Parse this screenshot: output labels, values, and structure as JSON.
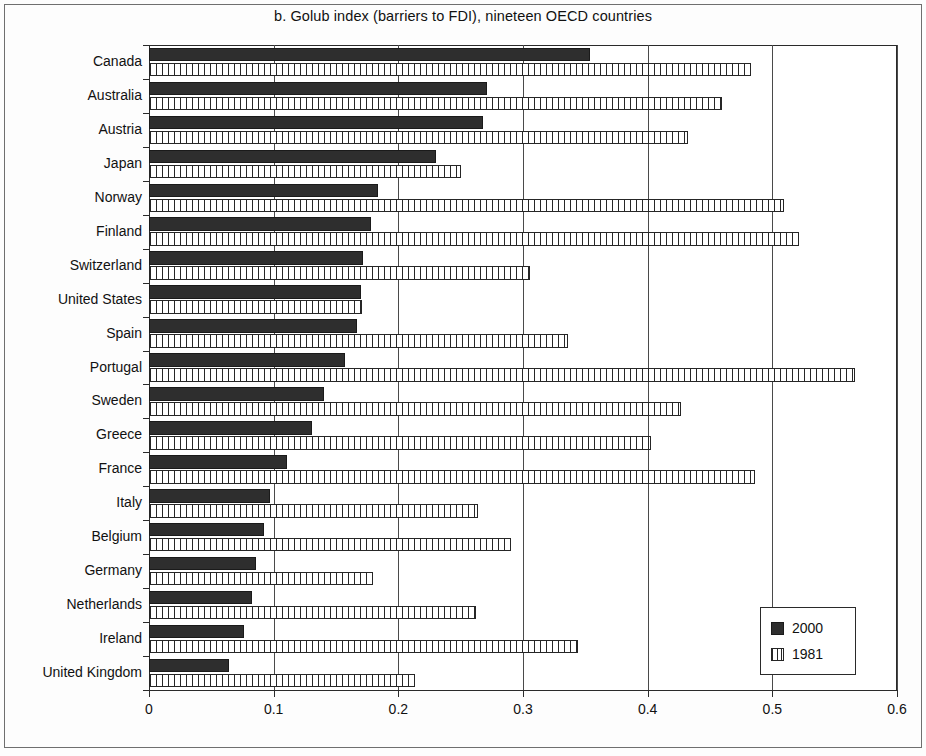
{
  "chart_data": {
    "type": "bar",
    "orientation": "horizontal",
    "title": "b. Golub index (barriers to FDI), nineteen OECD countries",
    "xlabel": "",
    "ylabel": "",
    "xlim": [
      0,
      0.6
    ],
    "xticks": [
      "0",
      "0.1",
      "0.2",
      "0.3",
      "0.4",
      "0.5",
      "0.6"
    ],
    "xtick_values": [
      0,
      0.1,
      0.2,
      0.3,
      0.4,
      0.5,
      0.6
    ],
    "grid": "vertical",
    "legend_position": "bottom-right",
    "categories": [
      "Canada",
      "Australia",
      "Austria",
      "Japan",
      "Norway",
      "Finland",
      "Switzerland",
      "United States",
      "Spain",
      "Portugal",
      "Sweden",
      "Greece",
      "France",
      "Italy",
      "Belgium",
      "Germany",
      "Netherlands",
      "Ireland",
      "United Kingdom"
    ],
    "series": [
      {
        "name": "2000",
        "color": "#2e2e2e",
        "fill": "solid",
        "values": [
          0.354,
          0.271,
          0.268,
          0.23,
          0.184,
          0.178,
          0.172,
          0.17,
          0.167,
          0.157,
          0.14,
          0.131,
          0.111,
          0.097,
          0.092,
          0.086,
          0.083,
          0.076,
          0.064
        ]
      },
      {
        "name": "1981",
        "color": "#ffffff",
        "fill": "hatched",
        "values": [
          0.483,
          0.46,
          0.432,
          0.25,
          0.509,
          0.521,
          0.306,
          0.171,
          0.336,
          0.566,
          0.427,
          0.403,
          0.486,
          0.264,
          0.29,
          0.18,
          0.262,
          0.344,
          0.213
        ]
      }
    ],
    "legend": [
      "2000",
      "1981"
    ]
  }
}
